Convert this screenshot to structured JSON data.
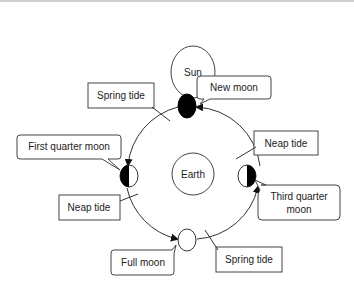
{
  "diagram": {
    "bodies": {
      "sun": {
        "label": "Sun"
      },
      "earth": {
        "label": "Earth"
      }
    },
    "moons": {
      "new": {
        "label": "New moon"
      },
      "first_quarter": {
        "label": "First quarter moon"
      },
      "third_quarter": {
        "label_line1": "Third quarter",
        "label_line2": "moon"
      },
      "full": {
        "label": "Full moon"
      }
    },
    "tides": {
      "spring_top": {
        "label": "Spring tide"
      },
      "neap_right": {
        "label": "Neap tide"
      },
      "neap_left": {
        "label": "Neap tide"
      },
      "spring_bottom": {
        "label": "Spring tide"
      }
    },
    "colors": {
      "stroke": "#333333",
      "fill_dark": "#000000",
      "background": "#ffffff"
    }
  }
}
